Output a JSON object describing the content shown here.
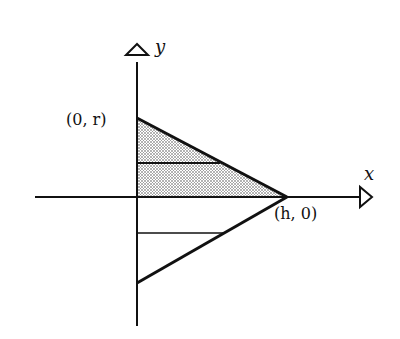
{
  "diagram": {
    "type": "coordinate-geometry",
    "axes": {
      "x_label": "x",
      "y_label": "y"
    },
    "points": {
      "top_vertex_label": "(0, r)",
      "right_vertex_label": "(h, 0)"
    },
    "colors": {
      "line": "#111111",
      "shade": "#bdbdbd",
      "background": "#ffffff"
    }
  }
}
